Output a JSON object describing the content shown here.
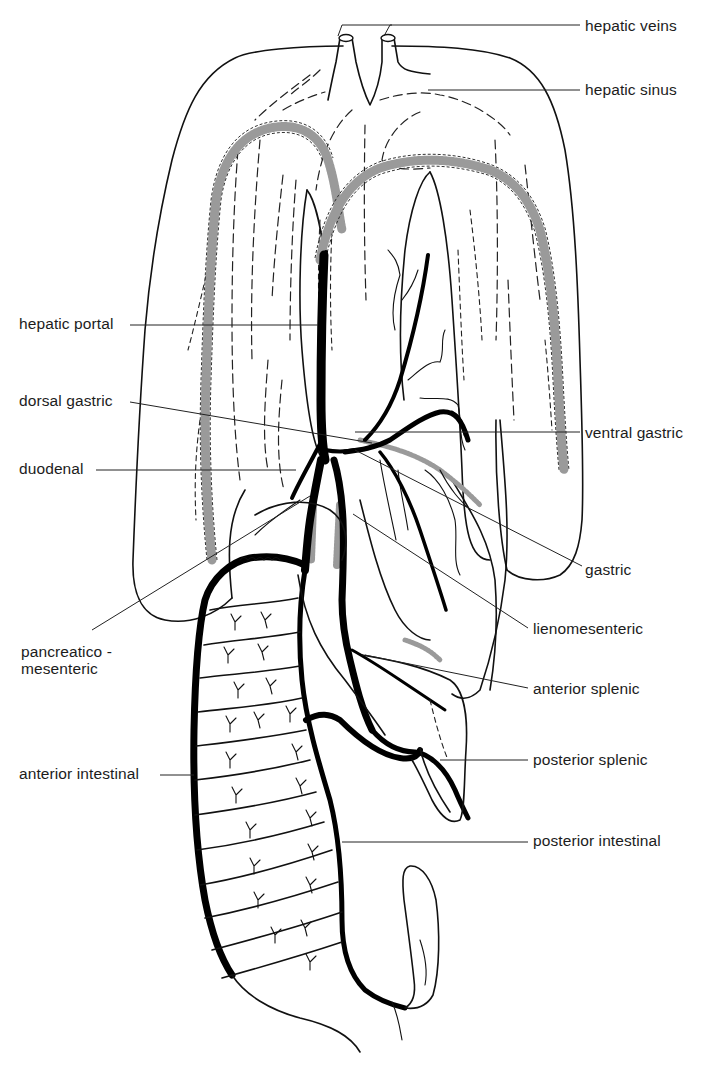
{
  "figure": {
    "type": "anatomical line drawing",
    "colors": {
      "ink": "#111111",
      "background": "#ffffff",
      "stippled_vessel": "#9a9a9a"
    }
  },
  "labels": {
    "right": [
      {
        "id": "hepatic-veins",
        "text": "hepatic veins",
        "x": 585,
        "y": 17
      },
      {
        "id": "hepatic-sinus",
        "text": "hepatic sinus",
        "x": 585,
        "y": 81
      },
      {
        "id": "ventral-gastric",
        "text": "ventral gastric",
        "x": 585,
        "y": 424
      },
      {
        "id": "gastric",
        "text": "gastric",
        "x": 585,
        "y": 561
      },
      {
        "id": "lienomesenteric",
        "text": "lienomesenteric",
        "x": 533,
        "y": 622
      },
      {
        "id": "anterior-splenic",
        "text": "anterior splenic",
        "x": 533,
        "y": 681
      },
      {
        "id": "posterior-splenic",
        "text": "posterior splenic",
        "x": 533,
        "y": 751
      },
      {
        "id": "posterior-intestinal",
        "text": "posterior intestinal",
        "x": 533,
        "y": 832
      }
    ],
    "left": [
      {
        "id": "hepatic-portal",
        "text": "hepatic portal",
        "x": 19,
        "y": 315
      },
      {
        "id": "dorsal-gastric",
        "text": "dorsal gastric",
        "x": 19,
        "y": 392
      },
      {
        "id": "duodenal",
        "text": "duodenal",
        "x": 19,
        "y": 460
      },
      {
        "id": "pancreatico-mesenteric",
        "text": "pancreatico -\nmesenteric",
        "x": 21,
        "y": 645
      },
      {
        "id": "anterior-intestinal",
        "text": "anterior intestinal",
        "x": 19,
        "y": 764
      }
    ]
  },
  "leader_lines": [
    {
      "label": "hepatic-veins",
      "points": [
        [
          580,
          25
        ],
        [
          390,
          25
        ],
        [
          384,
          36
        ]
      ]
    },
    {
      "label": "hepatic-veins-b",
      "points": [
        [
          392,
          25
        ],
        [
          342,
          25
        ],
        [
          338,
          36
        ]
      ]
    },
    {
      "label": "hepatic-sinus",
      "points": [
        [
          580,
          90
        ],
        [
          428,
          90
        ]
      ]
    },
    {
      "label": "hepatic-portal",
      "points": [
        [
          130,
          325
        ],
        [
          318,
          325
        ]
      ]
    },
    {
      "label": "dorsal-gastric",
      "points": [
        [
          130,
          402
        ],
        [
          372,
          443
        ]
      ]
    },
    {
      "label": "duodenal",
      "points": [
        [
          96,
          470
        ],
        [
          296,
          470
        ]
      ]
    },
    {
      "label": "ventral-gastric",
      "points": [
        [
          580,
          432
        ],
        [
          355,
          432
        ]
      ]
    },
    {
      "label": "gastric",
      "points": [
        [
          582,
          566
        ],
        [
          355,
          450
        ]
      ]
    },
    {
      "label": "lienomesenteric",
      "points": [
        [
          528,
          628
        ],
        [
          353,
          514
        ]
      ]
    },
    {
      "label": "anterior-splenic",
      "points": [
        [
          528,
          688
        ],
        [
          365,
          655
        ]
      ]
    },
    {
      "label": "posterior-splenic",
      "points": [
        [
          528,
          760
        ],
        [
          440,
          760
        ]
      ]
    },
    {
      "label": "posterior-intestinal",
      "points": [
        [
          528,
          842
        ],
        [
          342,
          842
        ]
      ]
    },
    {
      "label": "pancreatico-mesenteric",
      "points": [
        [
          92,
          630
        ],
        [
          310,
          496
        ]
      ]
    },
    {
      "label": "anterior-intestinal",
      "points": [
        [
          160,
          775
        ],
        [
          190,
          775
        ]
      ]
    }
  ]
}
